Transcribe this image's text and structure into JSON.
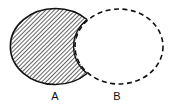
{
  "diagram": {
    "type": "venn",
    "sets": [
      {
        "name": "A",
        "label": "A",
        "style": "solid",
        "shaded": true
      },
      {
        "name": "B",
        "label": "B",
        "style": "dashed",
        "shaded": false
      }
    ],
    "shaded_region": "A - B",
    "colors": {
      "stroke": "#111111",
      "hatch": "#222222",
      "background": "#ffffff"
    }
  }
}
